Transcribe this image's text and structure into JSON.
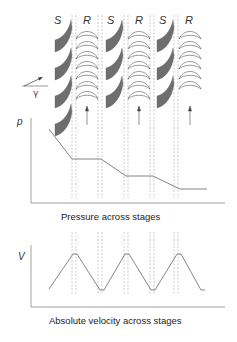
{
  "stage_labels": [
    {
      "id": "s1",
      "text": "S"
    },
    {
      "id": "r1",
      "text": "R"
    },
    {
      "id": "s2",
      "text": "S"
    },
    {
      "id": "r2",
      "text": "R"
    },
    {
      "id": "s3",
      "text": "S"
    },
    {
      "id": "r3",
      "text": "R"
    }
  ],
  "angle_label": "γ",
  "pressure_plot": {
    "axis_label": "p",
    "caption": "Pressure across stages",
    "profile": "drops across each stator, constant across each rotor",
    "stages": 3
  },
  "velocity_plot": {
    "axis_label": "V",
    "caption": "Absolute velocity across stages",
    "profile": "rises across each stator, falls across each rotor",
    "stages": 3
  },
  "colors": {
    "stator_fill": "#6e6e6e",
    "line": "#777777",
    "dashed": "#aaaaaa",
    "text": "#333333"
  }
}
